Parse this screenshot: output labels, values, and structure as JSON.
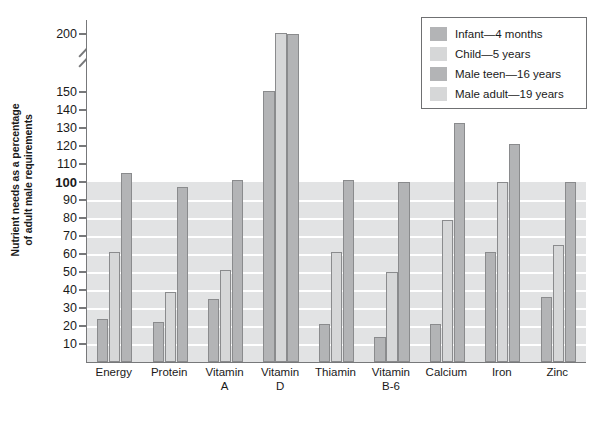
{
  "chart_data": {
    "type": "bar",
    "title": "",
    "xlabel": "",
    "ylabel": "Nutrient needs as a percentage of adult male requirements",
    "ylabel_line1": "Nutrient needs as a percentage",
    "ylabel_line2": "of adult male requirements",
    "ylim": [
      0,
      200
    ],
    "yticks": [
      10,
      20,
      30,
      40,
      50,
      60,
      70,
      80,
      90,
      100,
      110,
      120,
      130,
      140,
      150,
      200
    ],
    "ytick_labels": [
      "10",
      "20",
      "30",
      "40",
      "50",
      "60",
      "70",
      "80",
      "90",
      "100",
      "110",
      "120",
      "130",
      "140",
      "150",
      "200"
    ],
    "axis_break_between": [
      150,
      200
    ],
    "grid": "horizontal-white-lines-below-100",
    "legend_position": "top-right",
    "reference_line": 100,
    "categories": [
      "Energy",
      "Protein",
      "Vitamin A",
      "Vitamin D",
      "Thiamin",
      "Vitamin B-6",
      "Calcium",
      "Iron",
      "Zinc"
    ],
    "category_lines": [
      [
        "Energy"
      ],
      [
        "Protein"
      ],
      [
        "Vitamin",
        "A"
      ],
      [
        "Vitamin",
        "D"
      ],
      [
        "Thiamin"
      ],
      [
        "Vitamin",
        "B-6"
      ],
      [
        "Calcium"
      ],
      [
        "Iron"
      ],
      [
        "Zinc"
      ]
    ],
    "series": [
      {
        "name": "Infant—4 months",
        "color": "#b3b4b6",
        "shade": "dark",
        "values": [
          24,
          22,
          35,
          151,
          21,
          14,
          21,
          61,
          36
        ]
      },
      {
        "name": "Child—5 years",
        "color": "#d6d7d8",
        "shade": "light",
        "values": [
          61,
          39,
          51,
          201,
          61,
          50,
          79,
          100,
          65
        ]
      },
      {
        "name": "Male teen—16 years",
        "color": "#b3b4b6",
        "shade": "dark",
        "values": [
          105,
          97,
          101,
          200,
          101,
          100,
          133,
          121,
          100
        ]
      },
      {
        "name": "Male adult—19 years",
        "color": "#d6d7d8",
        "shade": "light",
        "values": [
          100,
          100,
          100,
          100,
          100,
          100,
          100,
          100,
          100
        ]
      }
    ]
  },
  "legend": {
    "items": [
      {
        "label": "Infant—4 months",
        "shade": "dark"
      },
      {
        "label": "Child—5 years",
        "shade": "light"
      },
      {
        "label": "Male teen—16 years",
        "shade": "dark"
      },
      {
        "label": "Male adult—19 years",
        "shade": "light"
      }
    ]
  },
  "caption": {
    "text": ""
  }
}
